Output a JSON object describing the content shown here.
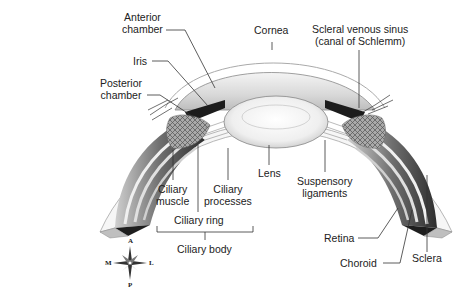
{
  "diagram": {
    "labels": {
      "anterior_chamber_1": "Anterior",
      "anterior_chamber_2": "chamber",
      "iris": "Iris",
      "posterior_chamber_1": "Posterior",
      "posterior_chamber_2": "chamber",
      "cornea": "Cornea",
      "scleral_sinus_1": "Scleral venous sinus",
      "scleral_sinus_2": "(canal of Schlemm)",
      "ciliary_muscle_1": "Ciliary",
      "ciliary_muscle_2": "muscle",
      "ciliary_processes_1": "Ciliary",
      "ciliary_processes_2": "processes",
      "lens": "Lens",
      "suspensory_1": "Suspensory",
      "suspensory_2": "ligaments",
      "ciliary_ring": "Ciliary ring",
      "ciliary_body": "Ciliary body",
      "retina": "Retina",
      "choroid": "Choroid",
      "sclera": "Sclera"
    },
    "compass": {
      "anterior": "A",
      "posterior": "P",
      "medial": "M",
      "lateral": "L"
    },
    "colors": {
      "background": "#ffffff",
      "leader_line": "#333333",
      "text": "#222222",
      "tissue_dark": "#2a2a2a",
      "tissue_mid": "#8a8a8a",
      "tissue_light": "#e6e6e6"
    }
  }
}
